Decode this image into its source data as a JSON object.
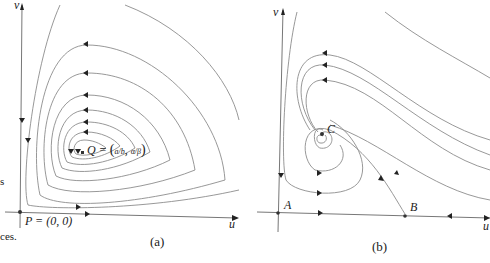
{
  "figure": {
    "panel_a": {
      "caption": "(a)",
      "axis_x_label": "u",
      "axis_y_label": "v",
      "origin_label": "P = (0, 0)",
      "center_label": "Q = ",
      "center_coord_x": "a/b",
      "center_coord_y": "α/β",
      "description": "closed orbits around center Q"
    },
    "panel_b": {
      "caption": "(b)",
      "axis_x_label": "u",
      "axis_y_label": "v",
      "point_a_label": "A",
      "point_b_label": "B",
      "point_c_label": "C",
      "description": "trajectories spiral into stable focus C"
    },
    "edge_text": {
      "fragment_1": "s",
      "fragment_2": "ces."
    }
  }
}
